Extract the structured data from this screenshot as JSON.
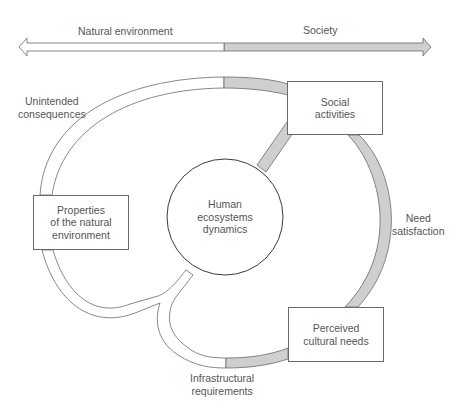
{
  "axis": {
    "left_label": "Natural environment",
    "right_label": "Society"
  },
  "nodes": {
    "center": "Human\necosystems\ndynamics",
    "social_activities": "Social\nactivities",
    "perceived_cultural_needs": "Perceived\ncultural needs",
    "properties_natural_env": "Properties\nof the natural\nenvironment"
  },
  "flows": {
    "unintended_consequences": "Unintended\nconsequences",
    "need_satisfaction": "Need\nsatisfaction",
    "infrastructural_requirements": "Infrastructural\nrequirements"
  },
  "colors": {
    "society_fill": "#cfcfcf",
    "nature_fill": "#ffffff",
    "stroke": "#6a6a6a",
    "text": "#555555"
  }
}
